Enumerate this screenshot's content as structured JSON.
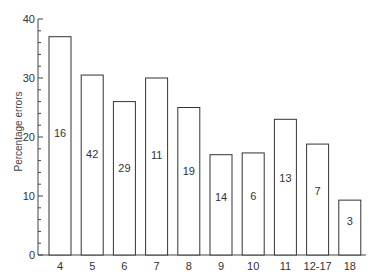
{
  "chart_data": {
    "type": "bar",
    "title": "",
    "xlabel": "",
    "ylabel": "Percentage errors",
    "ylim": [
      0,
      40
    ],
    "yticks": [
      0,
      10,
      20,
      30,
      40
    ],
    "minor_tick_step": 2,
    "grid": false,
    "legend": null,
    "categories": [
      "4",
      "5",
      "6",
      "7",
      "8",
      "9",
      "10",
      "11",
      "12-17",
      "18"
    ],
    "values": [
      37,
      30.5,
      26,
      30,
      25,
      17,
      17.3,
      23,
      18.8,
      9.3
    ],
    "bar_labels": [
      "16",
      "42",
      "29",
      "11",
      "19",
      "14",
      "6",
      "13",
      "7",
      "3"
    ]
  },
  "style": {
    "bar_fill": "#ffffff",
    "bar_stroke": "#333333",
    "axis_color": "#444444",
    "text_color": "#333333"
  }
}
